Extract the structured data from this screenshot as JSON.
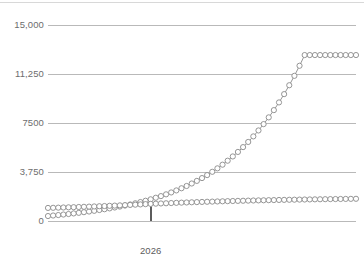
{
  "chart_data": {
    "type": "line",
    "title": "",
    "subtitle": "",
    "xlabel": "",
    "ylabel": "",
    "grid": true,
    "legend_position": "none",
    "ylim": [
      0,
      15000
    ],
    "y_ticks": [
      0,
      3750,
      7500,
      11250,
      15000
    ],
    "y_tick_labels": [
      "0",
      "3,750",
      "7500",
      "11,250",
      "15,000"
    ],
    "x_ticks": [
      2026
    ],
    "x_tick_labels": [
      "2026"
    ],
    "xlim": [
      2018,
      2042
    ],
    "annotations": [
      {
        "name": "year-marker",
        "label": "2026",
        "x": 2026
      }
    ],
    "marker_style": "open-circle",
    "series": [
      {
        "name": "exponential-series",
        "color": "#888888",
        "x": [
          2018,
          2018.4,
          2018.8,
          2019.2,
          2019.6,
          2020,
          2020.4,
          2020.8,
          2021.2,
          2021.6,
          2022,
          2022.4,
          2022.8,
          2023.2,
          2023.6,
          2024,
          2024.4,
          2024.8,
          2025.2,
          2025.6,
          2026,
          2026.4,
          2026.8,
          2027.2,
          2027.6,
          2028,
          2028.4,
          2028.8,
          2029.2,
          2029.6,
          2030,
          2030.4,
          2030.8,
          2031.2,
          2031.6,
          2032,
          2032.4,
          2032.8,
          2033.2,
          2033.6,
          2034,
          2034.4,
          2034.8,
          2035.2,
          2035.6,
          2036,
          2036.4,
          2036.8,
          2037.2,
          2037.6,
          2038,
          2038.4,
          2038.8,
          2039.2,
          2039.6,
          2040,
          2040.4,
          2040.8,
          2041.2,
          2041.6,
          2042
        ],
        "values": [
          380,
          420,
          455,
          495,
          535,
          580,
          625,
          675,
          725,
          780,
          840,
          900,
          965,
          1035,
          1105,
          1185,
          1265,
          1355,
          1450,
          1550,
          1660,
          1780,
          1905,
          2040,
          2185,
          2340,
          2505,
          2680,
          2870,
          3070,
          3285,
          3515,
          3765,
          4030,
          4310,
          4615,
          4940,
          5285,
          5655,
          6050,
          6475,
          6930,
          7415,
          7930,
          8485,
          9075,
          9710,
          10390,
          11110,
          11880,
          12700,
          12700,
          12700,
          12700,
          12700,
          12700,
          12700,
          12700,
          12700,
          12700,
          12700
        ]
      },
      {
        "name": "linear-series",
        "color": "#9a9a9a",
        "x": [
          2018,
          2018.4,
          2018.8,
          2019.2,
          2019.6,
          2020,
          2020.4,
          2020.8,
          2021.2,
          2021.6,
          2022,
          2022.4,
          2022.8,
          2023.2,
          2023.6,
          2024,
          2024.4,
          2024.8,
          2025.2,
          2025.6,
          2026,
          2026.4,
          2026.8,
          2027.2,
          2027.6,
          2028,
          2028.4,
          2028.8,
          2029.2,
          2029.6,
          2030,
          2030.4,
          2030.8,
          2031.2,
          2031.6,
          2032,
          2032.4,
          2032.8,
          2033.2,
          2033.6,
          2034,
          2034.4,
          2034.8,
          2035.2,
          2035.6,
          2036,
          2036.4,
          2036.8,
          2037.2,
          2037.6,
          2038,
          2038.4,
          2038.8,
          2039.2,
          2039.6,
          2040,
          2040.4,
          2040.8,
          2041.2,
          2041.6,
          2042
        ],
        "values": [
          1000,
          1010,
          1022,
          1034,
          1046,
          1058,
          1072,
          1086,
          1100,
          1114,
          1130,
          1146,
          1162,
          1178,
          1196,
          1214,
          1232,
          1250,
          1270,
          1290,
          1310,
          1326,
          1342,
          1358,
          1374,
          1390,
          1404,
          1418,
          1432,
          1446,
          1460,
          1472,
          1484,
          1496,
          1508,
          1520,
          1530,
          1540,
          1550,
          1560,
          1570,
          1578,
          1586,
          1594,
          1602,
          1610,
          1617,
          1624,
          1631,
          1638,
          1645,
          1651,
          1657,
          1663,
          1669,
          1675,
          1680,
          1685,
          1690,
          1695,
          1700
        ]
      }
    ]
  },
  "style": {
    "gridline_color": "#b9b9b9",
    "axis_color": "#b9b9b9",
    "marker_fill": "#ffffff",
    "marker_stroke": "#8a8a8a",
    "line_color": "#8a8a8a",
    "tick_label_color": "#6d6d6d",
    "marker_line_color": "#5c5c5c",
    "background": "#ffffff"
  }
}
